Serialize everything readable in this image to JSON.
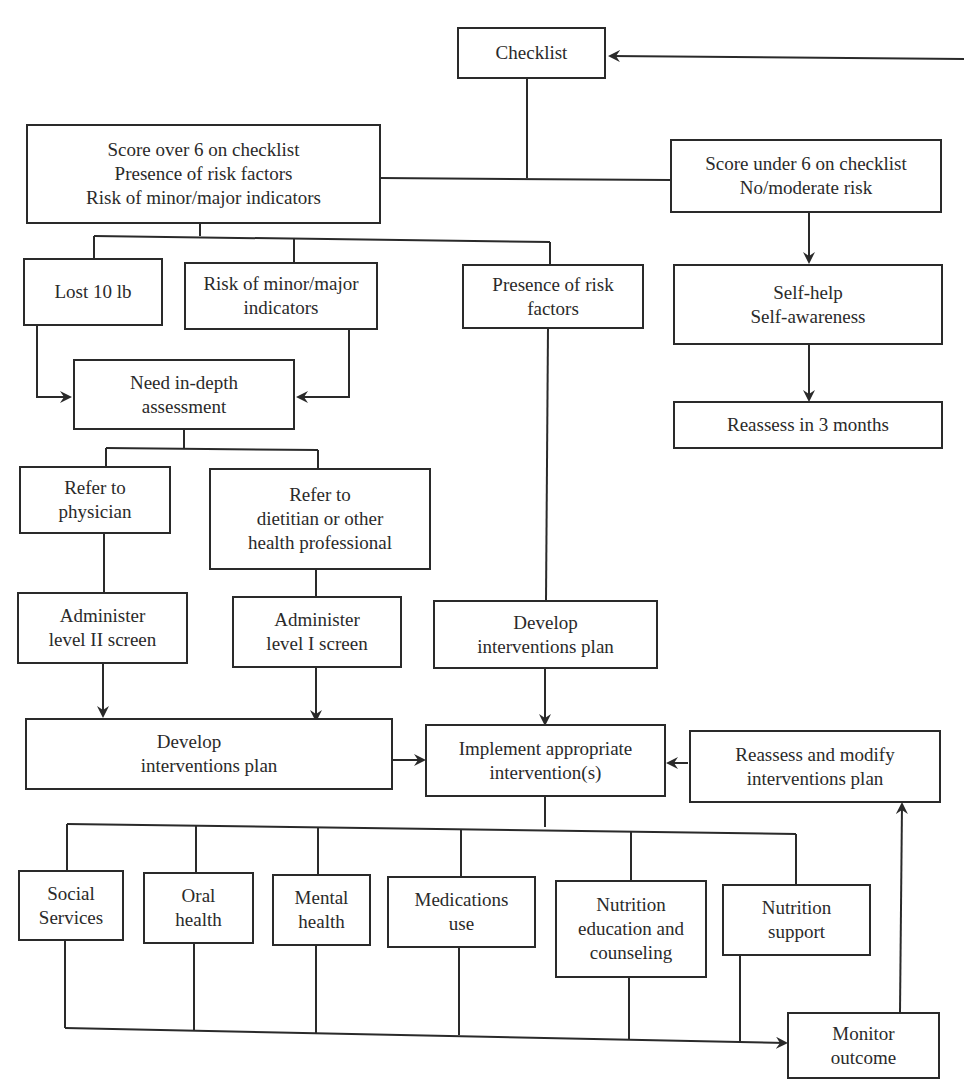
{
  "diagram": {
    "type": "flowchart",
    "colors": {
      "stroke": "#2a2a2a",
      "background": "#ffffff",
      "text": "#2a2a2a"
    },
    "nodes": {
      "checklist": {
        "lines": [
          "Checklist"
        ]
      },
      "score_over": {
        "lines": [
          "Score over 6 on checklist",
          "Presence of risk factors",
          "Risk of minor/major indicators"
        ]
      },
      "score_under": {
        "lines": [
          "Score under 6 on checklist",
          "No/moderate risk"
        ]
      },
      "lost_10lb": {
        "lines": [
          "Lost 10 lb"
        ]
      },
      "risk_indicators": {
        "lines": [
          "Risk of minor/major",
          "indicators"
        ]
      },
      "presence_risk": {
        "lines": [
          "Presence of risk",
          "factors"
        ]
      },
      "self_help": {
        "lines": [
          "Self-help",
          "Self-awareness"
        ]
      },
      "reassess_3mo": {
        "lines": [
          "Reassess in 3 months"
        ]
      },
      "need_assessment": {
        "lines": [
          "Need in-depth",
          "assessment"
        ]
      },
      "refer_physician": {
        "lines": [
          "Refer to",
          "physician"
        ]
      },
      "refer_dietitian": {
        "lines": [
          "Refer to",
          "dietitian or other",
          "health professional"
        ]
      },
      "admin_level2": {
        "lines": [
          "Administer",
          "level II screen"
        ]
      },
      "admin_level1": {
        "lines": [
          "Administer",
          "level I screen"
        ]
      },
      "develop_plan_right": {
        "lines": [
          "Develop",
          "interventions plan"
        ]
      },
      "develop_plan_left": {
        "lines": [
          "Develop",
          "interventions plan"
        ]
      },
      "implement": {
        "lines": [
          "Implement appropriate",
          "intervention(s)"
        ]
      },
      "reassess_modify": {
        "lines": [
          "Reassess and modify",
          "interventions plan"
        ]
      },
      "social_services": {
        "lines": [
          "Social",
          "Services"
        ]
      },
      "oral_health": {
        "lines": [
          "Oral",
          "health"
        ]
      },
      "mental_health": {
        "lines": [
          "Mental",
          "health"
        ]
      },
      "medications": {
        "lines": [
          "Medications",
          "use"
        ]
      },
      "nutrition_education": {
        "lines": [
          "Nutrition",
          "education and",
          "counseling"
        ]
      },
      "nutrition_support": {
        "lines": [
          "Nutrition",
          "support"
        ]
      },
      "monitor": {
        "lines": [
          "Monitor",
          "outcome"
        ]
      }
    },
    "edges": [
      {
        "from": "checklist",
        "to": [
          "score_over",
          "score_under"
        ],
        "arrow": false
      },
      {
        "from": "score_under",
        "to": "self_help",
        "arrow": true
      },
      {
        "from": "self_help",
        "to": "reassess_3mo",
        "arrow": true
      },
      {
        "from": "score_over",
        "to": [
          "lost_10lb",
          "risk_indicators",
          "presence_risk"
        ],
        "arrow": false
      },
      {
        "from": "lost_10lb",
        "to": "need_assessment",
        "arrow": true
      },
      {
        "from": "risk_indicators",
        "to": "need_assessment",
        "arrow": true
      },
      {
        "from": "need_assessment",
        "to": [
          "refer_physician",
          "refer_dietitian"
        ],
        "arrow": false
      },
      {
        "from": "refer_physician",
        "to": "admin_level2",
        "arrow": false
      },
      {
        "from": "refer_dietitian",
        "to": "admin_level1",
        "arrow": false
      },
      {
        "from": "presence_risk",
        "to": "develop_plan_right",
        "arrow": false
      },
      {
        "from": "admin_level2",
        "to": "develop_plan_left",
        "arrow": true
      },
      {
        "from": "admin_level1",
        "to": "develop_plan_left",
        "arrow": true
      },
      {
        "from": "develop_plan_right",
        "to": "implement",
        "arrow": true
      },
      {
        "from": "develop_plan_left",
        "to": "implement",
        "arrow": true
      },
      {
        "from": "reassess_modify",
        "to": "implement",
        "arrow": true
      },
      {
        "from": "implement",
        "to": [
          "social_services",
          "oral_health",
          "mental_health",
          "medications",
          "nutrition_education",
          "nutrition_support"
        ],
        "arrow": false
      },
      {
        "from": [
          "social_services",
          "oral_health",
          "mental_health",
          "medications",
          "nutrition_education",
          "nutrition_support"
        ],
        "to": "monitor",
        "arrow": true
      },
      {
        "from": "monitor",
        "to": "reassess_modify",
        "arrow": true
      },
      {
        "from": "offpage-right",
        "to": "checklist",
        "arrow": true
      }
    ]
  }
}
